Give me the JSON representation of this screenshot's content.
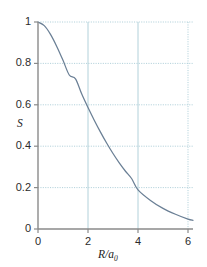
{
  "chart_data": {
    "type": "line",
    "title": "",
    "xlabel": "R/a0",
    "xlabel_main": "R/a",
    "xlabel_sub": "0",
    "ylabel": "S",
    "xlim": [
      0,
      6.2
    ],
    "ylim": [
      0,
      1
    ],
    "xticks": [
      0,
      2,
      4,
      6
    ],
    "xtick_labels": [
      "0",
      "2",
      "4",
      "6"
    ],
    "yticks": [
      0,
      0.2,
      0.4,
      0.6,
      0.8,
      1
    ],
    "ytick_labels": [
      "0",
      "0.2",
      "0.4",
      "0.6",
      "0.8",
      "1"
    ],
    "grid": true,
    "grid_style": "dotted",
    "legend": "none",
    "series": [
      {
        "name": "overlap-integral",
        "color": "#6a7f95",
        "x": [
          0,
          0.2,
          0.4,
          0.6,
          0.8,
          1.0,
          1.2,
          1.4,
          1.6,
          1.8,
          2.0,
          2.2,
          2.4,
          2.6,
          2.8,
          3.0,
          3.2,
          3.4,
          3.6,
          3.8,
          4.0,
          4.2,
          4.4,
          4.6,
          4.8,
          5.0,
          5.2,
          5.4,
          5.6,
          5.8,
          6.0,
          6.2
        ],
        "y": [
          1.0,
          0.9989,
          0.9953,
          0.9896,
          0.9818,
          0.9722,
          0.961,
          0.9484,
          0.9345,
          0.9195,
          0.9037,
          0.887,
          0.8697,
          0.8519,
          0.8336,
          0.815,
          0.7962,
          0.7772,
          0.7581,
          0.7389,
          0.7197,
          0.7006,
          0.6815,
          0.6626,
          0.6439,
          0.6253,
          0.6069,
          0.5888,
          0.5709,
          0.5533,
          0.536,
          0.5189
        ]
      }
    ],
    "curve_points": [
      [
        0.0,
        1.0
      ],
      [
        0.25,
        0.9823
      ],
      [
        0.5,
        0.9402
      ],
      [
        0.75,
        0.8821
      ],
      [
        1.0,
        0.8149
      ],
      [
        1.25,
        0.744
      ],
      [
        1.5,
        0.7251
      ],
      [
        1.75,
        0.6519
      ],
      [
        2.0,
        0.5865
      ],
      [
        2.25,
        0.5255
      ],
      [
        2.5,
        0.4679
      ],
      [
        2.75,
        0.4142
      ],
      [
        3.0,
        0.3647
      ],
      [
        3.25,
        0.3196
      ],
      [
        3.5,
        0.279
      ],
      [
        3.75,
        0.2427
      ],
      [
        4.0,
        0.1893
      ],
      [
        4.5,
        0.1382
      ],
      [
        5.0,
        0.0996
      ],
      [
        5.5,
        0.071
      ],
      [
        6.0,
        0.0474
      ],
      [
        6.2,
        0.042
      ]
    ],
    "annotations": []
  }
}
